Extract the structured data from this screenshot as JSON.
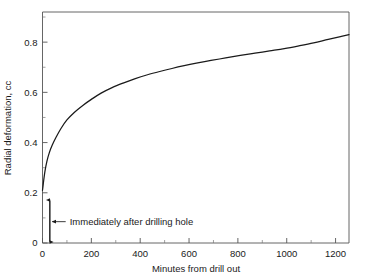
{
  "chart_data": {
    "type": "line",
    "title": "",
    "xlabel": "Minutes from drill out",
    "ylabel": "Radial deformation, cc",
    "xlim": [
      0,
      1255
    ],
    "ylim": [
      0,
      0.92
    ],
    "grid": false,
    "legend": null,
    "x_ticks": [
      0,
      200,
      400,
      600,
      800,
      1000,
      1200
    ],
    "x_tick_labels": [
      "0",
      "200",
      "400",
      "600",
      "800",
      "1000",
      "1200"
    ],
    "x_minor_interval": 100,
    "y_ticks": [
      0,
      0.2,
      0.4,
      0.6,
      0.8
    ],
    "y_tick_labels": [
      "0",
      "0.2",
      "0.4",
      "0.6",
      "0.8"
    ],
    "y_minor_interval": 0.1,
    "series": [
      {
        "name": "Radial deformation",
        "color": "#1a1a1a",
        "x": [
          0,
          2,
          5,
          10,
          18,
          28,
          40,
          55,
          75,
          100,
          130,
          165,
          200,
          240,
          285,
          330,
          380,
          430,
          480,
          530,
          580,
          630,
          690,
          750,
          810,
          870,
          930,
          990,
          1050,
          1110,
          1170,
          1220,
          1255
        ],
        "y": [
          0.21,
          0.225,
          0.25,
          0.285,
          0.325,
          0.36,
          0.39,
          0.42,
          0.455,
          0.49,
          0.52,
          0.548,
          0.572,
          0.597,
          0.619,
          0.637,
          0.655,
          0.67,
          0.683,
          0.695,
          0.706,
          0.716,
          0.727,
          0.737,
          0.747,
          0.756,
          0.765,
          0.774,
          0.785,
          0.797,
          0.811,
          0.822,
          0.83
        ]
      }
    ],
    "annotations": [
      {
        "name": "immediately-after-drilling-hole",
        "text": "Immediately after drilling hole",
        "measure_x": 30,
        "measure_y_low": 0.0,
        "measure_y_high": 0.175,
        "pointer_from_x": 95,
        "pointer_to_x": 40,
        "pointer_y": 0.085
      }
    ]
  }
}
